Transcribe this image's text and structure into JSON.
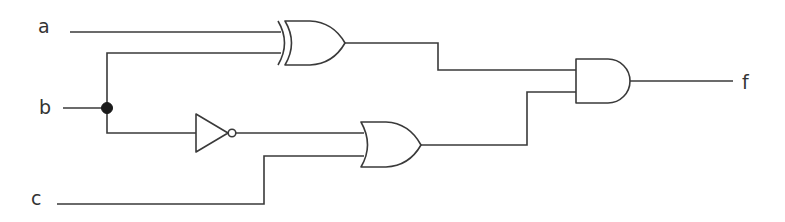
{
  "diagram": {
    "type": "logic-circuit",
    "inputs": [
      {
        "id": "a",
        "label": "a"
      },
      {
        "id": "b",
        "label": "b"
      },
      {
        "id": "c",
        "label": "c"
      }
    ],
    "outputs": [
      {
        "id": "f",
        "label": "f"
      }
    ],
    "gates": [
      {
        "id": "xor1",
        "type": "XOR",
        "inputs": [
          "a",
          "b"
        ]
      },
      {
        "id": "not1",
        "type": "NOT",
        "inputs": [
          "b"
        ]
      },
      {
        "id": "or1",
        "type": "OR",
        "inputs": [
          "not1",
          "c"
        ]
      },
      {
        "id": "and1",
        "type": "AND",
        "inputs": [
          "xor1",
          "or1"
        ],
        "output": "f"
      }
    ],
    "junctions": [
      {
        "id": "b-split",
        "signal": "b"
      }
    ],
    "colors": {
      "stroke": "#3a3a3a",
      "background": "#ffffff"
    }
  }
}
